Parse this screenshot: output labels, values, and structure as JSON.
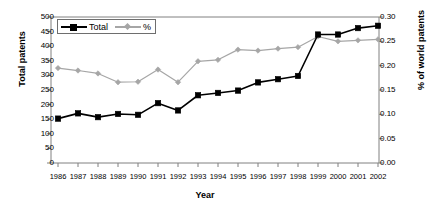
{
  "chart_data": {
    "type": "line",
    "title": "",
    "xlabel": "Year",
    "ylabel": "Total patents",
    "y2label": "% of world patents",
    "categories": [
      "1986",
      "1987",
      "1988",
      "1989",
      "1990",
      "1991",
      "1992",
      "1993",
      "1994",
      "1995",
      "1996",
      "1997",
      "1998",
      "1999",
      "2000",
      "2001",
      "2002"
    ],
    "ylim": [
      0,
      500
    ],
    "yticks": [
      "0",
      "50",
      "100",
      "150",
      "200",
      "250",
      "300",
      "350",
      "400",
      "450",
      "500"
    ],
    "y2lim": [
      0,
      0.3
    ],
    "y2ticks": [
      "0.00",
      "0.05",
      "0.10",
      "0.15",
      "0.20",
      "0.25",
      "0.30"
    ],
    "grid": false,
    "legend_position": "top-left",
    "series": [
      {
        "name": "Total",
        "axis": "left",
        "color": "#000000",
        "marker": "square",
        "values": [
          152,
          170,
          157,
          168,
          165,
          205,
          180,
          232,
          240,
          248,
          276,
          287,
          298,
          440,
          440,
          462,
          470
        ]
      },
      {
        "name": "%",
        "axis": "right",
        "color": "#a6a6a6",
        "marker": "diamond",
        "values": [
          0.195,
          0.19,
          0.184,
          0.166,
          0.167,
          0.192,
          0.166,
          0.209,
          0.212,
          0.233,
          0.231,
          0.235,
          0.238,
          0.26,
          0.25,
          0.252,
          0.254
        ]
      }
    ]
  },
  "legend": {
    "items": [
      {
        "label": "Total"
      },
      {
        "label": "%"
      }
    ]
  },
  "colors": {
    "total_series": "#000000",
    "percent_series": "#a6a6a6",
    "axis": "#808080",
    "text": "#000000"
  }
}
